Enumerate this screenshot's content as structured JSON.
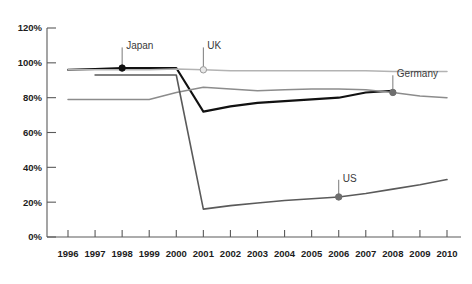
{
  "chart_data": {
    "type": "line",
    "title": "",
    "subtitle": "",
    "xlabel": "",
    "ylabel": "",
    "x": [
      1996,
      1997,
      1998,
      1999,
      2000,
      2001,
      2002,
      2003,
      2004,
      2005,
      2006,
      2007,
      2008,
      2009,
      2010
    ],
    "xlim": [
      1996,
      2010
    ],
    "ylim": [
      0,
      120
    ],
    "yticks": [
      0,
      20,
      40,
      60,
      80,
      100,
      120
    ],
    "ytick_labels": [
      "0%",
      "20%",
      "40%",
      "60%",
      "80%",
      "100%",
      "120%"
    ],
    "xtick_labels": [
      "1996",
      "1997",
      "1998",
      "1999",
      "2000",
      "2001",
      "2002",
      "2003",
      "2004",
      "2005",
      "2006",
      "2007",
      "2008",
      "2009",
      "2010"
    ],
    "grid": false,
    "legend": "inline-annotations",
    "series": [
      {
        "name": "Japan",
        "color": "#111111",
        "width": 2.1,
        "marker_x": 1998,
        "marker_y": 97,
        "marker_style": "filled-circle",
        "label_x": 1998,
        "label_y": 110,
        "x": [
          1996,
          1997,
          1998,
          1999,
          2000,
          2001,
          2002,
          2003,
          2004,
          2005,
          2006,
          2007,
          2008
        ],
        "values": [
          96,
          96.5,
          97,
          97,
          97,
          72,
          75,
          77,
          78,
          79,
          80,
          83,
          84
        ]
      },
      {
        "name": "UK",
        "color": "#b3b3b3",
        "width": 1.5,
        "marker_x": 2001,
        "marker_y": 96,
        "marker_style": "open-circle",
        "label_x": 2001,
        "label_y": 110,
        "x": [
          1996,
          1997,
          1998,
          1999,
          2000,
          2001,
          2002,
          2003,
          2004,
          2005,
          2006,
          2007,
          2008,
          2009,
          2010
        ],
        "values": [
          96,
          96,
          96,
          96,
          96.5,
          96,
          95.5,
          95.5,
          95.5,
          95.5,
          95.5,
          95.5,
          95,
          95,
          95
        ]
      },
      {
        "name": "Germany",
        "color": "#8c8c8c",
        "width": 1.5,
        "marker_x": 2008,
        "marker_y": 83,
        "marker_style": "filled-circle-gray",
        "label_x": 2008,
        "label_y": 94,
        "x": [
          1996,
          1997,
          1998,
          1999,
          2000,
          2001,
          2002,
          2003,
          2004,
          2005,
          2006,
          2007,
          2008,
          2009,
          2010
        ],
        "values": [
          79,
          79,
          79,
          79,
          83,
          86,
          85,
          84,
          84.5,
          85,
          85,
          84.5,
          83,
          81,
          80
        ]
      },
      {
        "name": "US",
        "color": "#5a5a5a",
        "width": 1.6,
        "marker_x": 2006,
        "marker_y": 23,
        "marker_style": "filled-circle-gray",
        "label_x": 2006,
        "label_y": 34,
        "x": [
          1997,
          1998,
          1999,
          2000,
          2001,
          2002,
          2003,
          2004,
          2005,
          2006,
          2007,
          2008,
          2009,
          2010
        ],
        "values": [
          93,
          93,
          93,
          93,
          16,
          18,
          19.5,
          21,
          22,
          23,
          25,
          27.5,
          30,
          33
        ]
      }
    ]
  },
  "axis": {
    "y_labels": [
      "120%",
      "100%",
      "80%",
      "60%",
      "40%",
      "20%",
      "0%"
    ],
    "x_labels": [
      "1996",
      "1997",
      "1998",
      "1999",
      "2000",
      "2001",
      "2002",
      "2003",
      "2004",
      "2005",
      "2006",
      "2007",
      "2008",
      "2009",
      "2010"
    ]
  },
  "annotations": [
    {
      "name": "Japan"
    },
    {
      "name": "UK"
    },
    {
      "name": "Germany"
    },
    {
      "name": "US"
    }
  ]
}
